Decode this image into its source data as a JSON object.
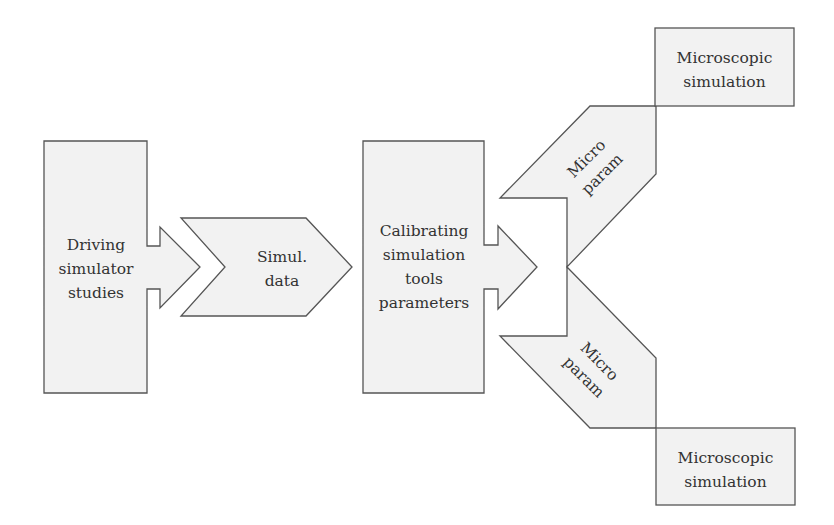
{
  "diagram": {
    "colors": {
      "fill": "#f2f2f2",
      "stroke": "#555555",
      "text": "#333333"
    },
    "nodes": {
      "driving_simulator": {
        "lines": [
          "Driving",
          "simulator",
          "studies"
        ]
      },
      "simul_data": {
        "lines": [
          "Simul.",
          "data"
        ]
      },
      "calibrating": {
        "lines": [
          "Calibrating",
          "simulation",
          "tools",
          "parameters"
        ]
      },
      "micro_param_upper": {
        "lines": [
          "Micro",
          "param"
        ]
      },
      "micro_param_lower": {
        "lines": [
          "Micro",
          "param"
        ]
      },
      "microscopic_upper": {
        "lines": [
          "Microscopic",
          "simulation"
        ]
      },
      "microscopic_lower": {
        "lines": [
          "Microscopic",
          "simulation"
        ]
      }
    },
    "edges": [
      {
        "from": "driving_simulator",
        "to": "simul_data"
      },
      {
        "from": "simul_data",
        "to": "calibrating"
      },
      {
        "from": "calibrating",
        "to": "micro_param_upper"
      },
      {
        "from": "calibrating",
        "to": "micro_param_lower"
      },
      {
        "from": "micro_param_upper",
        "to": "microscopic_upper"
      },
      {
        "from": "micro_param_lower",
        "to": "microscopic_lower"
      }
    ]
  }
}
